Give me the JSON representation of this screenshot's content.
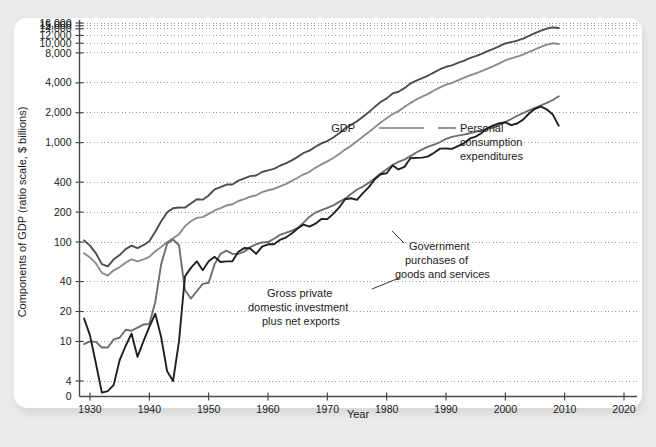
{
  "chart_data": {
    "type": "line",
    "title": "",
    "xlabel": "Year",
    "ylabel": "Components of GDP (ratio scale, $ billions)",
    "scale": "log",
    "grid": true,
    "legend_position": "inline-annotations",
    "xlim": [
      1928,
      2022
    ],
    "xticks": [
      1930,
      1940,
      1950,
      1960,
      1970,
      1980,
      1990,
      2000,
      2010,
      2020
    ],
    "yticks": [
      0,
      4,
      10,
      20,
      40,
      100,
      200,
      400,
      1000,
      2000,
      4000,
      8000,
      10000,
      12000,
      14000,
      15000,
      16000
    ],
    "ytick_labels": [
      "0",
      "4",
      "10",
      "20",
      "40",
      "100",
      "200",
      "400",
      "1,000",
      "2,000",
      "4,000",
      "8,000",
      "10,000",
      "12,000",
      "14,000",
      "15,000",
      "16,000"
    ],
    "colors": {
      "gdp": "#4d4d4d",
      "pce": "#8c8c8c",
      "government": "#6e6e6e",
      "investment": "#1f1f1f"
    },
    "series": [
      {
        "name": "GDP",
        "color": "#4d4d4d",
        "x": [
          1929,
          1930,
          1931,
          1932,
          1933,
          1934,
          1935,
          1936,
          1937,
          1938,
          1939,
          1940,
          1941,
          1942,
          1943,
          1944,
          1945,
          1946,
          1947,
          1948,
          1949,
          1950,
          1951,
          1952,
          1953,
          1954,
          1955,
          1956,
          1957,
          1958,
          1959,
          1960,
          1961,
          1962,
          1963,
          1964,
          1965,
          1966,
          1967,
          1968,
          1969,
          1970,
          1971,
          1972,
          1973,
          1974,
          1975,
          1976,
          1977,
          1978,
          1979,
          1980,
          1981,
          1982,
          1983,
          1984,
          1985,
          1986,
          1987,
          1988,
          1989,
          1990,
          1991,
          1992,
          1993,
          1994,
          1995,
          1996,
          1997,
          1998,
          1999,
          2000,
          2001,
          2002,
          2003,
          2004,
          2005,
          2006,
          2007,
          2008,
          2009
        ],
        "y": [
          104,
          92,
          77,
          60,
          57,
          67,
          74,
          85,
          92,
          87,
          93,
          102,
          127,
          162,
          199,
          219,
          223,
          222,
          244,
          270,
          267,
          294,
          339,
          358,
          379,
          380,
          415,
          438,
          461,
          467,
          507,
          527,
          545,
          586,
          618,
          664,
          720,
          788,
          832,
          910,
          985,
          1039,
          1128,
          1247,
          1395,
          1514,
          1638,
          1825,
          2031,
          2294,
          2563,
          2790,
          3128,
          3255,
          3537,
          3933,
          4220,
          4463,
          4740,
          5104,
          5484,
          5803,
          5996,
          6338,
          6667,
          7085,
          7415,
          7839,
          8332,
          8794,
          9354,
          9952,
          10286,
          10642,
          11142,
          11868,
          12638,
          13399,
          14078,
          14441,
          14258
        ]
      },
      {
        "name": "Personal consumption expenditures",
        "color": "#8c8c8c",
        "x": [
          1929,
          1930,
          1931,
          1932,
          1933,
          1934,
          1935,
          1936,
          1937,
          1938,
          1939,
          1940,
          1941,
          1942,
          1943,
          1944,
          1945,
          1946,
          1947,
          1948,
          1949,
          1950,
          1951,
          1952,
          1953,
          1954,
          1955,
          1956,
          1957,
          1958,
          1959,
          1960,
          1961,
          1962,
          1963,
          1964,
          1965,
          1966,
          1967,
          1968,
          1969,
          1970,
          1971,
          1972,
          1973,
          1974,
          1975,
          1976,
          1977,
          1978,
          1979,
          1980,
          1981,
          1982,
          1983,
          1984,
          1985,
          1986,
          1987,
          1988,
          1989,
          1990,
          1991,
          1992,
          1993,
          1994,
          1995,
          1996,
          1997,
          1998,
          1999,
          2000,
          2001,
          2002,
          2003,
          2004,
          2005,
          2006,
          2007,
          2008,
          2009
        ],
        "y": [
          77,
          70,
          61,
          49,
          46,
          52,
          56,
          62,
          67,
          64,
          67,
          71,
          81,
          89,
          100,
          109,
          120,
          144,
          162,
          175,
          178,
          192,
          208,
          219,
          233,
          240,
          259,
          271,
          286,
          296,
          318,
          332,
          342,
          363,
          383,
          412,
          444,
          481,
          509,
          559,
          604,
          648,
          702,
          770,
          852,
          933,
          1034,
          1152,
          1278,
          1428,
          1592,
          1757,
          1941,
          2077,
          2290,
          2503,
          2720,
          2899,
          3100,
          3353,
          3598,
          3840,
          3986,
          4235,
          4477,
          4743,
          4976,
          5257,
          5547,
          5880,
          6282,
          6739,
          7055,
          7351,
          7704,
          8196,
          8694,
          9207,
          9710,
          10014,
          9847
        ]
      },
      {
        "name": "Government purchases of goods and services",
        "color": "#6e6e6e",
        "x": [
          1929,
          1930,
          1931,
          1932,
          1933,
          1934,
          1935,
          1936,
          1937,
          1938,
          1939,
          1940,
          1941,
          1942,
          1943,
          1944,
          1945,
          1946,
          1947,
          1948,
          1949,
          1950,
          1951,
          1952,
          1953,
          1954,
          1955,
          1956,
          1957,
          1958,
          1959,
          1960,
          1961,
          1962,
          1963,
          1964,
          1965,
          1966,
          1967,
          1968,
          1969,
          1970,
          1971,
          1972,
          1973,
          1974,
          1975,
          1976,
          1977,
          1978,
          1979,
          1980,
          1981,
          1982,
          1983,
          1984,
          1985,
          1986,
          1987,
          1988,
          1989,
          1990,
          1991,
          1992,
          1993,
          1994,
          1995,
          1996,
          1997,
          1998,
          1999,
          2000,
          2001,
          2002,
          2003,
          2004,
          2005,
          2006,
          2007,
          2008,
          2009
        ],
        "y": [
          9.4,
          10.0,
          9.9,
          8.7,
          8.7,
          10.5,
          10.9,
          13.1,
          12.8,
          13.8,
          14.8,
          15.0,
          25.0,
          60.0,
          96.0,
          106.0,
          93.0,
          33.0,
          27.0,
          32.0,
          38.0,
          39.0,
          60.0,
          76.0,
          82.0,
          76.0,
          76.0,
          80.0,
          89.0,
          95.0,
          99.0,
          100.0,
          108.0,
          118.0,
          124.0,
          130.0,
          139.0,
          157.0,
          180.0,
          198.0,
          210.0,
          221.0,
          234.0,
          254.0,
          273.0,
          305.0,
          338.0,
          362.0,
          396.0,
          438.0,
          490.0,
          541.0,
          597.0,
          640.0,
          676.0,
          733.0,
          797.0,
          857.0,
          912.0,
          958.0,
          1015.0,
          1090.0,
          1144.0,
          1178.0,
          1204.0,
          1245.0,
          1287.0,
          1330.0,
          1377.0,
          1420.0,
          1504.0,
          1608.0,
          1732.0,
          1866.0,
          1982.0,
          2113.0,
          2233.0,
          2372.0,
          2510.0,
          2688.0,
          2931.0
        ]
      },
      {
        "name": "Gross private domestic investment plus net exports",
        "color": "#1f1f1f",
        "x": [
          1929,
          1930,
          1931,
          1932,
          1933,
          1934,
          1935,
          1936,
          1937,
          1938,
          1939,
          1940,
          1941,
          1942,
          1943,
          1944,
          1945,
          1946,
          1947,
          1948,
          1949,
          1950,
          1951,
          1952,
          1953,
          1954,
          1955,
          1956,
          1957,
          1958,
          1959,
          1960,
          1961,
          1962,
          1963,
          1964,
          1965,
          1966,
          1967,
          1968,
          1969,
          1970,
          1971,
          1972,
          1973,
          1974,
          1975,
          1976,
          1977,
          1978,
          1979,
          1980,
          1981,
          1982,
          1983,
          1984,
          1985,
          1986,
          1987,
          1988,
          1989,
          1990,
          1991,
          1992,
          1993,
          1994,
          1995,
          1996,
          1997,
          1998,
          1999,
          2000,
          2001,
          2002,
          2003,
          2004,
          2005,
          2006,
          2007,
          2008,
          2009
        ],
        "y": [
          17.0,
          11.5,
          6.0,
          1.0,
          1.4,
          3.0,
          6.5,
          9.0,
          12.0,
          7.0,
          10.0,
          14.0,
          19.0,
          11.0,
          5.0,
          4.0,
          10.0,
          45.0,
          55.0,
          64.0,
          52.0,
          64.0,
          71.0,
          63.0,
          64.0,
          64.0,
          80.0,
          87.0,
          86.0,
          76.0,
          90.0,
          95.0,
          95.0,
          105.0,
          111.0,
          122.0,
          137.0,
          150.0,
          143.0,
          153.0,
          171.0,
          170.0,
          192.0,
          223.0,
          270.0,
          276.0,
          266.0,
          311.0,
          357.0,
          428.0,
          481.0,
          492.0,
          590.0,
          538.0,
          571.0,
          697.0,
          703.0,
          707.0,
          728.0,
          793.0,
          871.0,
          873.0,
          866.0,
          925.0,
          986.0,
          1097.0,
          1152.0,
          1252.0,
          1405.0,
          1494.0,
          1568.0,
          1605.0,
          1499.0,
          1560.0,
          1706.0,
          1966.0,
          2195.0,
          2304.0,
          2160.0,
          1917.0,
          1480.0
        ]
      }
    ],
    "annotations": [
      {
        "id": "gdp",
        "text": "GDP",
        "x": 357,
        "y": 132
      },
      {
        "id": "pce",
        "text_lines": [
          "Personal",
          "consumption",
          "expenditures"
        ],
        "x": 460,
        "y": 132
      },
      {
        "id": "government",
        "text_lines": [
          "Government",
          "purchases of",
          "goods and services"
        ],
        "x": 409,
        "y": 248
      },
      {
        "id": "investment",
        "text_lines": [
          "Gross private",
          "domestic investment",
          "plus net exports"
        ],
        "x": 272,
        "y": 297
      }
    ]
  },
  "axes": {
    "ylabel": "Components of GDP (ratio scale, $ billions)",
    "xlabel": "Year",
    "ytick_labels": [
      "16,000",
      "15,000",
      "14,000",
      "12,000",
      "10,000",
      "8,000",
      "4,000",
      "2,000",
      "1,000",
      "400",
      "200",
      "100",
      "40",
      "20",
      "10",
      "4",
      "0"
    ],
    "xtick_labels": [
      "1930",
      "1940",
      "1950",
      "1960",
      "1970",
      "1980",
      "1990",
      "2000",
      "2010",
      "2020"
    ]
  },
  "annotation_text": {
    "gdp": "GDP",
    "pce_l1": "Personal",
    "pce_l2": "consumption",
    "pce_l3": "expenditures",
    "gov_l1": "Government",
    "gov_l2": "purchases of",
    "gov_l3": "goods and services",
    "inv_l1": "Gross private",
    "inv_l2": "domestic investment",
    "inv_l3": "plus net exports"
  }
}
